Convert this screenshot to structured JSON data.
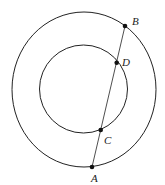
{
  "diagram": {
    "outer_circle": {
      "cx": 84,
      "cy": 89.5,
      "rx": 72,
      "ry": 77.5
    },
    "inner_circle": {
      "cx": 83.5,
      "cy": 89,
      "rx": 44,
      "ry": 44
    },
    "line": {
      "from": "A",
      "to": "B"
    },
    "points": [
      {
        "label": "A",
        "x": 92,
        "y": 167,
        "lx": 91,
        "ly": 182
      },
      {
        "label": "C",
        "x": 100.7,
        "y": 130,
        "lx": 104,
        "ly": 144
      },
      {
        "label": "D",
        "x": 116.7,
        "y": 62.7,
        "lx": 122,
        "ly": 66
      },
      {
        "label": "B",
        "x": 125,
        "y": 26,
        "lx": 132,
        "ly": 25
      }
    ],
    "stroke_color": "#222222"
  }
}
